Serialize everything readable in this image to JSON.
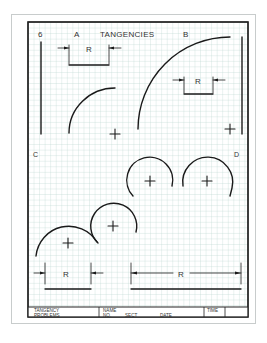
{
  "sheet": {
    "number": "6",
    "title": "TANGENCIES",
    "region_labels": {
      "a": "A",
      "b": "B",
      "c": "C",
      "d": "D"
    },
    "dimension_label": "R",
    "grid_color": "#b9d4cf",
    "line_color": "#1a1a1a"
  },
  "title_block": {
    "problem_name_line1": "TANGENCY",
    "problem_name_line2": "PROBLEMS",
    "name_label": "NAME",
    "no_label": "NO.",
    "sect_label": "SECT",
    "date_label": "DATE",
    "time_label": "TIME"
  }
}
